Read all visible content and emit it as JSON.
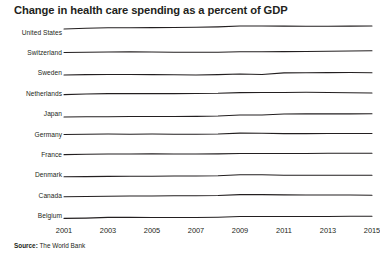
{
  "title": "Change in health care spending as a percent of GDP",
  "source": {
    "lead": "Source:",
    "text": " The World Bank"
  },
  "colors": {
    "line": "#231f20",
    "text": "#231f20",
    "background": "#ffffff"
  },
  "chart_data": {
    "type": "line",
    "title": "Change in health care spending as a percent of GDP",
    "subtitle": "",
    "xlabel": "",
    "ylabel": "",
    "grid": false,
    "legend_position": "left-row-labels",
    "layout": "small-multiples-sparklines",
    "x": [
      2001,
      2002,
      2003,
      2004,
      2005,
      2006,
      2007,
      2008,
      2009,
      2010,
      2011,
      2012,
      2013,
      2014,
      2015
    ],
    "xlim": [
      2001,
      2015
    ],
    "xticks": [
      "2001",
      "2003",
      "2005",
      "2007",
      "2009",
      "2011",
      "2013",
      "2015"
    ],
    "xtick_values": [
      2001,
      2003,
      2005,
      2007,
      2009,
      2011,
      2013,
      2015
    ],
    "ylim": [
      4.0,
      18.0
    ],
    "series": [
      {
        "name": "United States",
        "values": [
          13.9,
          14.8,
          15.2,
          15.3,
          15.4,
          15.5,
          15.7,
          16.2,
          17.2,
          17.1,
          17.0,
          16.9,
          16.8,
          17.0,
          17.1
        ]
      },
      {
        "name": "Switzerland",
        "values": [
          10.1,
          10.4,
          10.7,
          10.8,
          10.7,
          10.3,
          10.3,
          10.5,
          11.0,
          11.0,
          11.1,
          11.3,
          11.5,
          11.7,
          12.1
        ]
      },
      {
        "name": "Sweden",
        "values": [
          8.6,
          8.9,
          9.1,
          9.0,
          8.9,
          8.7,
          8.6,
          8.9,
          9.5,
          9.0,
          10.8,
          11.0,
          11.1,
          11.2,
          11.0
        ]
      },
      {
        "name": "Netherlands",
        "values": [
          8.9,
          9.5,
          10.0,
          10.0,
          10.0,
          10.0,
          10.1,
          10.3,
          11.1,
          11.3,
          11.2,
          11.4,
          11.2,
          10.9,
          10.7
        ]
      },
      {
        "name": "Japan",
        "values": [
          7.5,
          7.7,
          7.8,
          7.9,
          8.0,
          8.0,
          8.1,
          8.5,
          9.5,
          9.5,
          10.6,
          10.8,
          10.8,
          10.8,
          10.9
        ]
      },
      {
        "name": "Germany",
        "values": [
          10.2,
          10.5,
          10.7,
          10.4,
          10.6,
          10.5,
          10.4,
          10.6,
          11.6,
          11.5,
          11.1,
          11.1,
          11.2,
          11.2,
          11.2
        ]
      },
      {
        "name": "France",
        "values": [
          10.0,
          10.3,
          10.6,
          10.7,
          10.8,
          10.7,
          10.7,
          10.8,
          11.3,
          11.2,
          11.2,
          11.3,
          11.4,
          11.5,
          11.5
        ]
      },
      {
        "name": "Denmark",
        "values": [
          8.7,
          8.9,
          9.2,
          9.3,
          9.4,
          9.6,
          9.7,
          9.9,
          11.0,
          10.9,
          10.5,
          10.5,
          10.4,
          10.5,
          10.3
        ]
      },
      {
        "name": "Canada",
        "values": [
          8.7,
          9.1,
          9.4,
          9.5,
          9.6,
          9.8,
          9.9,
          10.1,
          11.1,
          11.1,
          10.8,
          10.7,
          10.6,
          10.6,
          10.4
        ]
      },
      {
        "name": "Belgium",
        "values": [
          8.1,
          8.4,
          9.2,
          9.2,
          9.1,
          9.0,
          9.1,
          9.4,
          10.2,
          10.2,
          10.1,
          10.2,
          10.2,
          10.4,
          10.4
        ]
      }
    ]
  }
}
